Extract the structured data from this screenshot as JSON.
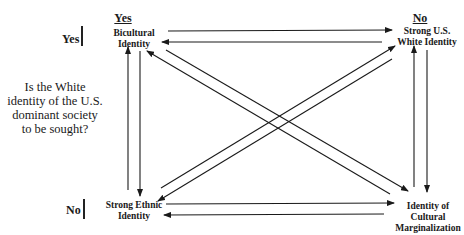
{
  "diagram": {
    "question": "Is the White identity of the U.S. dominant society to be sought?",
    "question_lines": [
      "Is the White",
      "identity of the U.S.",
      "dominant society",
      "to be sought?"
    ],
    "row_labels": {
      "yes": "Yes",
      "no": "No"
    },
    "column_headers": {
      "yes": "Yes",
      "no": "No"
    },
    "nodes": {
      "bicultural": {
        "lines": [
          "Bicultural",
          "Identity"
        ],
        "position": "top-left"
      },
      "strong_white": {
        "lines": [
          "Strong U.S.",
          "White Identity"
        ],
        "position": "top-right"
      },
      "strong_ethnic": {
        "lines": [
          "Strong Ethnic",
          "Identity"
        ],
        "position": "bottom-left"
      },
      "marginalization": {
        "lines": [
          "Identity of",
          "Cultural",
          "Marginalization"
        ],
        "position": "bottom-right"
      }
    },
    "edges": [
      {
        "from": "bicultural",
        "to": "strong_white"
      },
      {
        "from": "strong_white",
        "to": "bicultural"
      },
      {
        "from": "strong_ethnic",
        "to": "marginalization"
      },
      {
        "from": "marginalization",
        "to": "strong_ethnic"
      },
      {
        "from": "strong_ethnic",
        "to": "bicultural"
      },
      {
        "from": "bicultural",
        "to": "strong_ethnic"
      },
      {
        "from": "marginalization",
        "to": "strong_white"
      },
      {
        "from": "strong_white",
        "to": "marginalization"
      },
      {
        "from": "marginalization",
        "to": "bicultural"
      },
      {
        "from": "bicultural",
        "to": "marginalization"
      },
      {
        "from": "strong_ethnic",
        "to": "strong_white"
      },
      {
        "from": "strong_white",
        "to": "strong_ethnic"
      }
    ]
  }
}
